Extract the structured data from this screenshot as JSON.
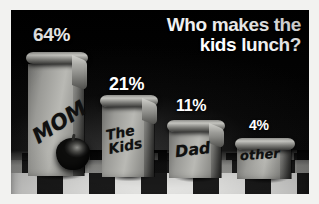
{
  "chart_data": {
    "type": "bar",
    "title": "Who makes the kids lunch?",
    "title_line1": "Who makes the",
    "title_line2": "kids lunch?",
    "xlabel": "",
    "ylabel": "",
    "ylim": [
      0,
      70
    ],
    "grid": false,
    "legend": "none",
    "unit": "%",
    "categories": [
      "MOM",
      "The Kids",
      "Dad",
      "other"
    ],
    "values": [
      64,
      11,
      11,
      4
    ],
    "value_labels": [
      "64%",
      "21%",
      "11%",
      "4%"
    ],
    "series": [
      {
        "name": "Who makes the kids lunch?",
        "values": [
          64,
          21,
          11,
          4
        ]
      }
    ],
    "points": [
      {
        "label": "MOM",
        "value": 64,
        "value_label": "64%"
      },
      {
        "label": "The Kids",
        "value": 21,
        "value_label": "21%"
      },
      {
        "label": "Dad",
        "value": 11,
        "value_label": "11%"
      },
      {
        "label": "other",
        "value": 4,
        "value_label": "4%"
      }
    ],
    "style_notes": "Bars rendered as paper lunch bags with handwritten marker labels, standing on a black-and-white checkerboard floor against a black backdrop."
  },
  "figure": {
    "background_color": "#050505",
    "border_color": "#f2f2f0",
    "title_color": "#ffffff",
    "label_color": "#ffffff",
    "bag_color": "#b9b9b4",
    "floor_light": "#e9e9e7",
    "floor_dark": "#1b1b1b"
  },
  "bags": [
    {
      "label": "MOM",
      "pct": "64%",
      "scrawl": "MOM"
    },
    {
      "label": "The Kids",
      "pct": "21%",
      "scrawl": "The\nKids"
    },
    {
      "label": "Dad",
      "pct": "11%",
      "scrawl": "Dad"
    },
    {
      "label": "other",
      "pct": "4%",
      "scrawl": "other"
    }
  ],
  "props": {
    "apple": "apple"
  }
}
